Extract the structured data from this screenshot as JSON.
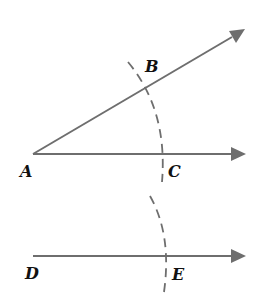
{
  "diagram": {
    "title": "",
    "type": "geometric construction: copying an angle",
    "colors": {
      "line": "#6e6e6e",
      "label": "#111111",
      "background": "#ffffff"
    },
    "points": {
      "A": {
        "label": "A",
        "x": 33,
        "y": 154
      },
      "B": {
        "label": "B",
        "x": 146,
        "y": 86
      },
      "C": {
        "label": "C",
        "x": 165,
        "y": 154
      },
      "D": {
        "label": "D",
        "x": 33,
        "y": 256
      },
      "E": {
        "label": "E",
        "x": 167,
        "y": 256
      }
    },
    "rays": [
      {
        "name": "ray-AB",
        "from": "A",
        "through": "B",
        "arrow": true
      },
      {
        "name": "ray-AC",
        "from": "A",
        "through": "C",
        "arrow": true
      },
      {
        "name": "ray-DE",
        "from": "D",
        "through": "E",
        "arrow": true
      }
    ],
    "arcs": [
      {
        "name": "arc-BC",
        "style": "dashed",
        "center": "A",
        "passes_through": [
          "B",
          "C"
        ]
      },
      {
        "name": "arc-E",
        "style": "dashed",
        "center": "D",
        "passes_through": [
          "E"
        ]
      }
    ]
  }
}
